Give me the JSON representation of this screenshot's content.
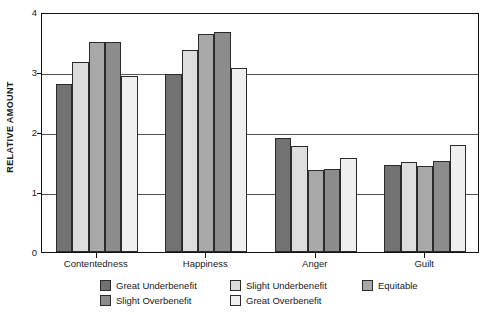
{
  "chart_data": {
    "type": "bar",
    "title": "",
    "xlabel": "",
    "ylabel": "RELATIVE AMOUNT",
    "ylim": [
      0,
      4
    ],
    "yticks": [
      0,
      1,
      2,
      3,
      4
    ],
    "ytick_labels": [
      "0",
      "1",
      "2",
      "3",
      "4"
    ],
    "grid": true,
    "grid_axis": "y",
    "legend_position": "bottom",
    "categories": [
      "Contentedness",
      "Happiness",
      "Anger",
      "Guilt"
    ],
    "series": [
      {
        "name": "Great Underbenefit",
        "color": "#727272",
        "values": [
          2.8,
          2.97,
          1.9,
          1.45
        ]
      },
      {
        "name": "Slight Underbenefit",
        "color": "#dddddd",
        "values": [
          3.17,
          3.37,
          1.76,
          1.5
        ]
      },
      {
        "name": "Equitable",
        "color": "#a8a8a8",
        "values": [
          3.5,
          3.64,
          1.37,
          1.43
        ]
      },
      {
        "name": "Slight Overbenefit",
        "color": "#8c8c8c",
        "values": [
          3.5,
          3.67,
          1.38,
          1.52
        ]
      },
      {
        "name": "Great Overbenefit",
        "color": "#efefef",
        "values": [
          2.93,
          3.06,
          1.56,
          1.79
        ]
      }
    ]
  },
  "legend": {
    "entries": [
      {
        "label": "Great Underbenefit"
      },
      {
        "label": "Slight Underbenefit"
      },
      {
        "label": "Equitable"
      },
      {
        "label": "Slight Overbenefit"
      },
      {
        "label": "Great Overbenefit"
      }
    ]
  }
}
